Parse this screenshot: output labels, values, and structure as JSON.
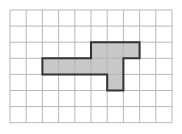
{
  "diagram": {
    "type": "grid-polyomino",
    "grid": {
      "cols": 10,
      "rows": 7,
      "origin_x": 10,
      "origin_y": 10,
      "cell_w": 16.2,
      "cell_h": 16.1,
      "line_color": "#b8b8b8",
      "background": "#ffffff"
    },
    "shape": {
      "fill": "#c8c8c8",
      "stroke": "#333333",
      "cell_count": 9,
      "cells": [
        [
          2,
          5
        ],
        [
          2,
          6
        ],
        [
          2,
          7
        ],
        [
          3,
          2
        ],
        [
          3,
          3
        ],
        [
          3,
          4
        ],
        [
          3,
          5
        ],
        [
          3,
          6
        ],
        [
          4,
          6
        ]
      ],
      "outline": [
        [
          5,
          2
        ],
        [
          8,
          2
        ],
        [
          8,
          3
        ],
        [
          7,
          3
        ],
        [
          7,
          5
        ],
        [
          6,
          5
        ],
        [
          6,
          4
        ],
        [
          2,
          4
        ],
        [
          2,
          3
        ],
        [
          5,
          3
        ]
      ]
    }
  }
}
